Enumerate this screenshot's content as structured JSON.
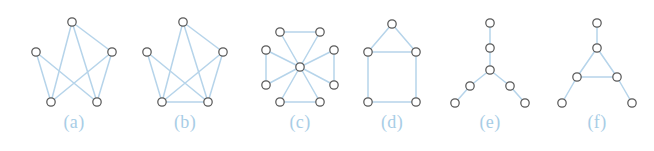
{
  "figure": {
    "background_color": "#ffffff",
    "edge_color": "#b6d4ea",
    "node_fill_color": "#ffffff",
    "node_stroke_color": "#5a5a5a",
    "label_color": "#a8cde6",
    "node_radius": 4.2,
    "width": 654,
    "height": 151
  },
  "chart_data": {
    "type": "diagram",
    "title": "",
    "subtitle": "",
    "xlabel": "",
    "ylabel": "",
    "legend": [],
    "panel_count": 6,
    "panels": [
      {
        "label": "(a)",
        "label_x": 74,
        "label_y": 113,
        "node_count": 5,
        "edge_count": 7,
        "nodes": [
          {
            "id": 0,
            "x": 72,
            "y": 22
          },
          {
            "id": 1,
            "x": 36,
            "y": 52
          },
          {
            "id": 2,
            "x": 112,
            "y": 52
          },
          {
            "id": 3,
            "x": 51,
            "y": 102
          },
          {
            "id": 4,
            "x": 97,
            "y": 102
          }
        ],
        "edges": [
          [
            0,
            2
          ],
          [
            0,
            3
          ],
          [
            0,
            4
          ],
          [
            1,
            3
          ],
          [
            1,
            4
          ],
          [
            2,
            3
          ],
          [
            2,
            4
          ]
        ]
      },
      {
        "label": "(b)",
        "label_x": 185,
        "label_y": 113,
        "node_count": 5,
        "edge_count": 8,
        "nodes": [
          {
            "id": 0,
            "x": 183,
            "y": 22
          },
          {
            "id": 1,
            "x": 147,
            "y": 52
          },
          {
            "id": 2,
            "x": 223,
            "y": 52
          },
          {
            "id": 3,
            "x": 162,
            "y": 102
          },
          {
            "id": 4,
            "x": 208,
            "y": 102
          }
        ],
        "edges": [
          [
            0,
            2
          ],
          [
            0,
            3
          ],
          [
            0,
            4
          ],
          [
            1,
            3
          ],
          [
            1,
            4
          ],
          [
            2,
            3
          ],
          [
            2,
            4
          ],
          [
            3,
            4
          ]
        ]
      },
      {
        "label": "(c)",
        "label_x": 300,
        "label_y": 113,
        "node_count": 9,
        "edge_count": 12,
        "nodes": [
          {
            "id": 0,
            "x": 300,
            "y": 67
          },
          {
            "id": 1,
            "x": 280,
            "y": 32
          },
          {
            "id": 2,
            "x": 320,
            "y": 32
          },
          {
            "id": 3,
            "x": 266,
            "y": 50
          },
          {
            "id": 4,
            "x": 266,
            "y": 85
          },
          {
            "id": 5,
            "x": 334,
            "y": 50
          },
          {
            "id": 6,
            "x": 334,
            "y": 85
          },
          {
            "id": 7,
            "x": 280,
            "y": 102
          },
          {
            "id": 8,
            "x": 320,
            "y": 102
          }
        ],
        "edges": [
          [
            0,
            1
          ],
          [
            0,
            2
          ],
          [
            0,
            3
          ],
          [
            0,
            4
          ],
          [
            0,
            5
          ],
          [
            0,
            6
          ],
          [
            0,
            7
          ],
          [
            0,
            8
          ],
          [
            1,
            2
          ],
          [
            3,
            4
          ],
          [
            5,
            6
          ],
          [
            7,
            8
          ]
        ]
      },
      {
        "label": "(d)",
        "label_x": 392,
        "label_y": 113,
        "node_count": 5,
        "edge_count": 6,
        "nodes": [
          {
            "id": 0,
            "x": 392,
            "y": 24
          },
          {
            "id": 1,
            "x": 368,
            "y": 52
          },
          {
            "id": 2,
            "x": 416,
            "y": 52
          },
          {
            "id": 3,
            "x": 368,
            "y": 102
          },
          {
            "id": 4,
            "x": 416,
            "y": 102
          }
        ],
        "edges": [
          [
            0,
            1
          ],
          [
            0,
            2
          ],
          [
            1,
            2
          ],
          [
            1,
            3
          ],
          [
            2,
            4
          ],
          [
            3,
            4
          ]
        ]
      },
      {
        "label": "(e)",
        "label_x": 490,
        "label_y": 113,
        "node_count": 7,
        "edge_count": 6,
        "nodes": [
          {
            "id": 0,
            "x": 490,
            "y": 23
          },
          {
            "id": 1,
            "x": 490,
            "y": 48
          },
          {
            "id": 2,
            "x": 490,
            "y": 70
          },
          {
            "id": 3,
            "x": 470,
            "y": 86
          },
          {
            "id": 4,
            "x": 510,
            "y": 86
          },
          {
            "id": 5,
            "x": 455,
            "y": 103
          },
          {
            "id": 6,
            "x": 525,
            "y": 103
          }
        ],
        "edges": [
          [
            0,
            1
          ],
          [
            1,
            2
          ],
          [
            2,
            3
          ],
          [
            2,
            4
          ],
          [
            3,
            5
          ],
          [
            4,
            6
          ]
        ]
      },
      {
        "label": "(f)",
        "label_x": 597,
        "label_y": 113,
        "node_count": 6,
        "edge_count": 6,
        "nodes": [
          {
            "id": 0,
            "x": 597,
            "y": 23
          },
          {
            "id": 1,
            "x": 597,
            "y": 48
          },
          {
            "id": 2,
            "x": 577,
            "y": 77
          },
          {
            "id": 3,
            "x": 617,
            "y": 77
          },
          {
            "id": 4,
            "x": 562,
            "y": 103
          },
          {
            "id": 5,
            "x": 632,
            "y": 103
          }
        ],
        "edges": [
          [
            0,
            1
          ],
          [
            1,
            2
          ],
          [
            1,
            3
          ],
          [
            2,
            3
          ],
          [
            2,
            4
          ],
          [
            3,
            5
          ]
        ]
      }
    ]
  }
}
